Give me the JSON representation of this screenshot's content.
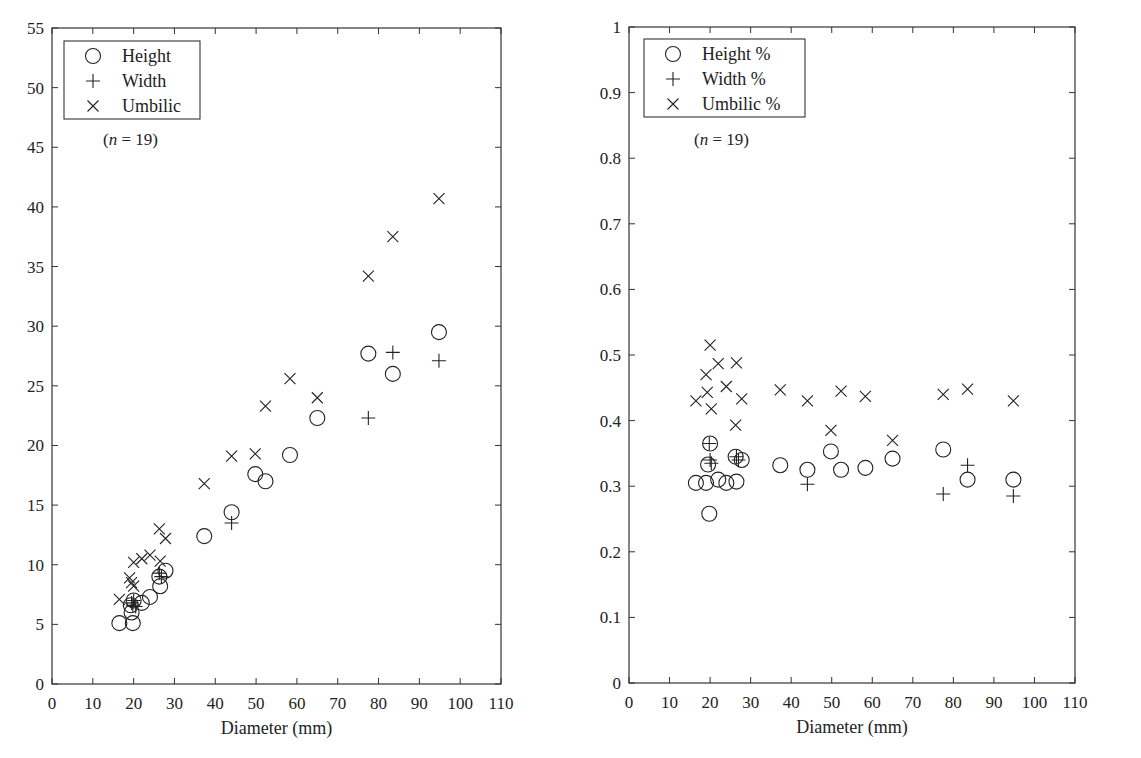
{
  "chart_data": [
    {
      "type": "scatter",
      "title": "",
      "xlabel": "Diameter (mm)",
      "ylabel": "",
      "xlim": [
        0,
        110
      ],
      "ylim": [
        0,
        55
      ],
      "xticks": [
        0,
        10,
        20,
        30,
        40,
        50,
        60,
        70,
        80,
        90,
        100,
        110
      ],
      "yticks": [
        0,
        5,
        10,
        15,
        20,
        25,
        30,
        35,
        40,
        45,
        50,
        55
      ],
      "grid": false,
      "legend_position": "upper-left",
      "annotation": "(n = 19)",
      "series": [
        {
          "name": "Height",
          "marker": "circle",
          "points": [
            [
              16.5,
              5.1
            ],
            [
              19.5,
              6.0
            ],
            [
              19.8,
              5.1
            ],
            [
              20.0,
              7.0
            ],
            [
              22.0,
              6.8
            ],
            [
              24.0,
              7.3
            ],
            [
              26.3,
              9.0
            ],
            [
              26.5,
              8.2
            ],
            [
              27.8,
              9.5
            ],
            [
              37.3,
              12.4
            ],
            [
              44.0,
              14.4
            ],
            [
              49.8,
              17.6
            ],
            [
              52.3,
              17.0
            ],
            [
              58.3,
              19.2
            ],
            [
              65.0,
              22.3
            ],
            [
              77.5,
              27.7
            ],
            [
              83.5,
              26.0
            ],
            [
              94.8,
              29.5
            ],
            [
              19.3,
              6.6
            ]
          ]
        },
        {
          "name": "Width",
          "marker": "plus",
          "points": [
            [
              16.5,
              null
            ],
            [
              19.5,
              6.8
            ],
            [
              19.8,
              6.6
            ],
            [
              20.0,
              7.0
            ],
            [
              20.5,
              6.5
            ],
            [
              26.3,
              9.3
            ],
            [
              26.8,
              9.0
            ],
            [
              44.0,
              13.5
            ],
            [
              77.5,
              22.3
            ],
            [
              83.5,
              27.8
            ],
            [
              94.8,
              27.1
            ]
          ]
        },
        {
          "name": "Umbilic",
          "marker": "x",
          "points": [
            [
              16.5,
              7.1
            ],
            [
              19.0,
              8.9
            ],
            [
              19.5,
              8.5
            ],
            [
              20.0,
              8.2
            ],
            [
              20.0,
              10.2
            ],
            [
              22.0,
              10.5
            ],
            [
              24.0,
              10.8
            ],
            [
              26.3,
              13.0
            ],
            [
              26.5,
              10.3
            ],
            [
              27.8,
              12.2
            ],
            [
              37.3,
              16.8
            ],
            [
              44.0,
              19.1
            ],
            [
              49.8,
              19.3
            ],
            [
              52.3,
              23.3
            ],
            [
              58.3,
              25.6
            ],
            [
              65.0,
              24.0
            ],
            [
              77.5,
              34.2
            ],
            [
              83.5,
              37.5
            ],
            [
              94.8,
              40.7
            ]
          ]
        }
      ]
    },
    {
      "type": "scatter",
      "title": "",
      "xlabel": "Diameter (mm)",
      "ylabel": "",
      "xlim": [
        0,
        110
      ],
      "ylim": [
        0,
        1
      ],
      "xticks": [
        0,
        10,
        20,
        30,
        40,
        50,
        60,
        70,
        80,
        90,
        100,
        110
      ],
      "yticks": [
        0,
        0.1,
        0.2,
        0.3,
        0.4,
        0.5,
        0.6,
        0.7,
        0.8,
        0.9,
        1
      ],
      "grid": false,
      "legend_position": "upper-left",
      "annotation": "(n = 19)",
      "series": [
        {
          "name": "Height %",
          "marker": "circle",
          "points": [
            [
              16.5,
              0.305
            ],
            [
              19.0,
              0.305
            ],
            [
              19.5,
              0.333
            ],
            [
              19.8,
              0.258
            ],
            [
              20.0,
              0.365
            ],
            [
              22.0,
              0.31
            ],
            [
              24.0,
              0.305
            ],
            [
              26.3,
              0.345
            ],
            [
              26.5,
              0.307
            ],
            [
              27.8,
              0.34
            ],
            [
              37.3,
              0.332
            ],
            [
              44.0,
              0.325
            ],
            [
              49.8,
              0.353
            ],
            [
              52.3,
              0.325
            ],
            [
              58.3,
              0.328
            ],
            [
              65.0,
              0.342
            ],
            [
              77.5,
              0.356
            ],
            [
              83.5,
              0.31
            ],
            [
              94.8,
              0.31
            ]
          ]
        },
        {
          "name": "Width %",
          "marker": "plus",
          "points": [
            [
              19.8,
              0.365
            ],
            [
              20.0,
              0.34
            ],
            [
              20.3,
              0.335
            ],
            [
              26.5,
              0.345
            ],
            [
              27.0,
              0.34
            ],
            [
              44.0,
              0.303
            ],
            [
              77.5,
              0.288
            ],
            [
              83.5,
              0.332
            ],
            [
              94.8,
              0.285
            ]
          ]
        },
        {
          "name": "Umbilic %",
          "marker": "x",
          "points": [
            [
              16.5,
              0.43
            ],
            [
              19.0,
              0.47
            ],
            [
              19.3,
              0.443
            ],
            [
              20.0,
              0.515
            ],
            [
              20.3,
              0.418
            ],
            [
              22.0,
              0.487
            ],
            [
              24.0,
              0.452
            ],
            [
              26.3,
              0.393
            ],
            [
              26.5,
              0.488
            ],
            [
              27.8,
              0.433
            ],
            [
              37.3,
              0.447
            ],
            [
              44.0,
              0.43
            ],
            [
              49.8,
              0.385
            ],
            [
              52.3,
              0.445
            ],
            [
              58.3,
              0.437
            ],
            [
              65.0,
              0.37
            ],
            [
              77.5,
              0.44
            ],
            [
              83.5,
              0.448
            ],
            [
              94.8,
              0.43
            ]
          ]
        }
      ]
    }
  ],
  "left_chart": {
    "legend": {
      "items": [
        {
          "symbol": "circle",
          "label": "Height"
        },
        {
          "symbol": "plus",
          "label": "Width"
        },
        {
          "symbol": "x",
          "label": "Umbilic"
        }
      ]
    },
    "annotation_n": "n",
    "annotation_rest": " = 19)",
    "annotation_open": "(",
    "xlabel": "Diameter (mm)"
  },
  "right_chart": {
    "legend": {
      "items": [
        {
          "symbol": "circle",
          "label": "Height %"
        },
        {
          "symbol": "plus",
          "label": "Width %"
        },
        {
          "symbol": "x",
          "label": "Umbilic %"
        }
      ]
    },
    "annotation_n": "n",
    "annotation_rest": " = 19)",
    "annotation_open": "(",
    "xlabel": "Diameter (mm)"
  },
  "colors": {
    "ink": "#222222",
    "frame": "#333333",
    "background": "#ffffff"
  }
}
